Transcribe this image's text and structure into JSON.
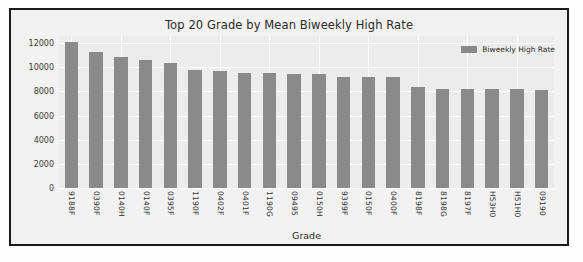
{
  "chart_data": {
    "type": "bar",
    "title": "Top 20 Grade by Mean Biweekly High Rate",
    "xlabel": "Grade",
    "ylabel": "",
    "ylim": [
      0,
      12600
    ],
    "yticks": [
      0,
      2000,
      4000,
      6000,
      8000,
      10000,
      12000
    ],
    "ytick_labels": [
      "0",
      "2000",
      "4000",
      "6000",
      "8000",
      "10000",
      "12000"
    ],
    "grid": true,
    "legend_position": "upper right",
    "legend": [
      "Biweekly High Rate"
    ],
    "categories": [
      "9188F",
      "0390F",
      "0140H",
      "0140F",
      "0395F",
      "1190F",
      "0402F",
      "0401F",
      "1190G",
      "09495",
      "0150H",
      "9399F",
      "0150F",
      "0400F",
      "8198F",
      "8198G",
      "8197F",
      "H53H0",
      "H51H0",
      "09190"
    ],
    "series": [
      {
        "name": "Biweekly High Rate",
        "color": "#8a8a8a",
        "values": [
          12100,
          11250,
          10850,
          10650,
          10400,
          9800,
          9700,
          9500,
          9500,
          9450,
          9450,
          9200,
          9200,
          9170,
          8400,
          8220,
          8200,
          8190,
          8190,
          8120
        ]
      }
    ]
  },
  "colors": {
    "bar": "#8a8a8a",
    "axes_background": "#ececec",
    "figure_background": "#f2f2f2",
    "grid": "#ffffff",
    "frame": "#1a1a1a",
    "text": "#2b2b2b"
  }
}
